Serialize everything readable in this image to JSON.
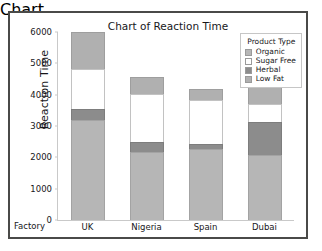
{
  "chart_data": {
    "type": "bar",
    "subtype": "stacked-bar",
    "title": "Chart of Reaction Time",
    "xlabel": "Factory",
    "ylabel": "Reaction Time",
    "categories": [
      "UK",
      "Nigeria",
      "Spain",
      "Dubai"
    ],
    "ylim": [
      0,
      6000
    ],
    "yticks": [
      0,
      1000,
      2000,
      3000,
      4000,
      5000,
      6000
    ],
    "ytick_labels": [
      "0",
      "1000",
      "2000",
      "3000",
      "4000",
      "5000",
      "6000"
    ],
    "grid": false,
    "legend_title": "Product Type",
    "legend_position": "top-right",
    "stack_order_bottom_to_top": [
      "Organic",
      "Herbal",
      "Sugar Free",
      "Low Fat"
    ],
    "series": [
      {
        "name": "Organic",
        "color": "#b6b6b6",
        "values": [
          3200,
          2180,
          2260,
          2080
        ]
      },
      {
        "name": "Sugar Free",
        "color": "#ffffff",
        "values": [
          1280,
          1520,
          1380,
          560
        ]
      },
      {
        "name": "Herbal",
        "color": "#8c8c8c",
        "values": [
          340,
          320,
          180,
          1060
        ]
      },
      {
        "name": "Low Fat",
        "color": "#b0b0b0",
        "values": [
          1180,
          560,
          360,
          780
        ]
      }
    ],
    "totals": [
      6000,
      4580,
      4180,
      4480
    ]
  },
  "legend": {
    "title": "Product Type",
    "entries": [
      {
        "label": "Organic",
        "color": "#b6b6b6"
      },
      {
        "label": "Sugar Free",
        "color": "#ffffff"
      },
      {
        "label": "Herbal",
        "color": "#8c8c8c"
      },
      {
        "label": "Low Fat",
        "color": "#b0b0b0"
      }
    ]
  }
}
